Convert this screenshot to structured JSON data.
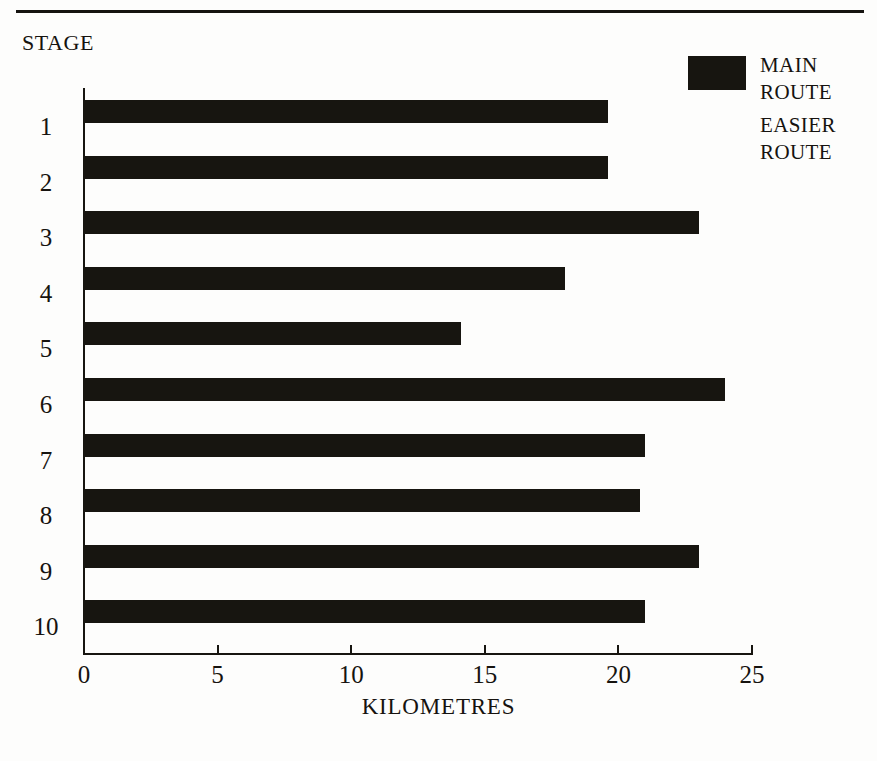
{
  "caption": "STAGE",
  "legend": {
    "items": [
      {
        "label": "MAIN\nROUTE",
        "swatch": "filled",
        "color": "#171510"
      },
      {
        "label": "EASIER\nROUTE",
        "swatch": "empty",
        "color": "#ffffff"
      }
    ]
  },
  "chart_data": {
    "type": "bar",
    "orientation": "horizontal",
    "title": "",
    "subtitle": "",
    "xlabel": "KILOMETRES",
    "ylabel": "STAGE",
    "categories": [
      "1",
      "2",
      "3",
      "4",
      "5",
      "6",
      "7",
      "8",
      "9",
      "10"
    ],
    "xlim": [
      0,
      25
    ],
    "xticks": [
      0,
      5,
      10,
      15,
      20,
      25
    ],
    "xtick_labels": [
      "0",
      "5",
      "10",
      "15",
      "20",
      "25"
    ],
    "grid": false,
    "legend_position": "top-right",
    "series": [
      {
        "name": "MAIN ROUTE",
        "color": "#171510",
        "values": [
          19.6,
          19.6,
          23.0,
          18.0,
          14.1,
          24.0,
          21.0,
          20.8,
          23.0,
          21.0
        ]
      },
      {
        "name": "EASIER ROUTE",
        "color": "#ffffff",
        "values": [
          0,
          0,
          0,
          0,
          0,
          0,
          0,
          0,
          0,
          0
        ]
      }
    ]
  }
}
